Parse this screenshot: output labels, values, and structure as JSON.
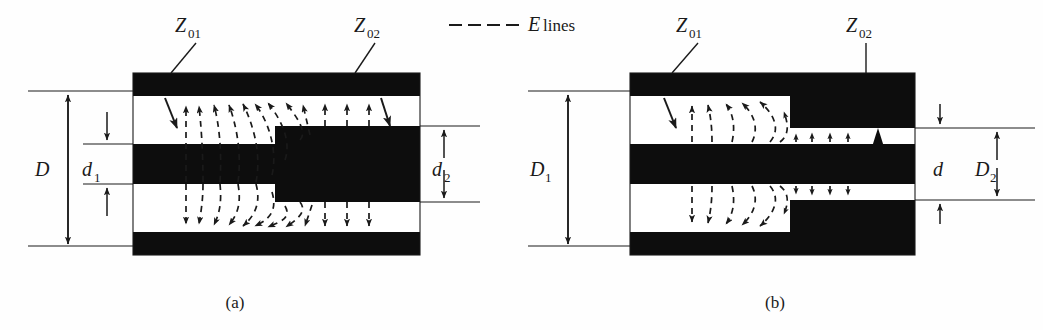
{
  "figure": {
    "title": "",
    "legend": {
      "symbol": "dashed-line",
      "label_italic": "E",
      "label_rest": " lines",
      "label_full": "E lines"
    },
    "panels": [
      {
        "id": "a",
        "caption": "(a)",
        "impedance_in": {
          "base": "Z",
          "sub": "01"
        },
        "impedance_out": {
          "base": "Z",
          "sub": "02"
        },
        "dimensions": [
          {
            "name": "outer-diameter",
            "base": "D",
            "sub": "",
            "side": "left"
          },
          {
            "name": "inner-diameter-1",
            "base": "d",
            "sub": "1",
            "side": "left"
          },
          {
            "name": "inner-diameter-2",
            "base": "d",
            "sub": "2",
            "side": "right"
          }
        ],
        "description": "coaxial step in inner conductor diameter"
      },
      {
        "id": "b",
        "caption": "(b)",
        "impedance_in": {
          "base": "Z",
          "sub": "01"
        },
        "impedance_out": {
          "base": "Z",
          "sub": "02"
        },
        "dimensions": [
          {
            "name": "outer-diameter-1",
            "base": "D",
            "sub": "1",
            "side": "left"
          },
          {
            "name": "inner-diameter",
            "base": "d",
            "sub": "",
            "side": "right"
          },
          {
            "name": "outer-diameter-2",
            "base": "D",
            "sub": "2",
            "side": "right"
          }
        ],
        "description": "coaxial step in outer conductor diameter"
      }
    ],
    "colors": {
      "conductor": "#0d0d0d",
      "dielectric": "#ffffff",
      "line": "#1a1a1a",
      "background": "#fefefe"
    }
  }
}
